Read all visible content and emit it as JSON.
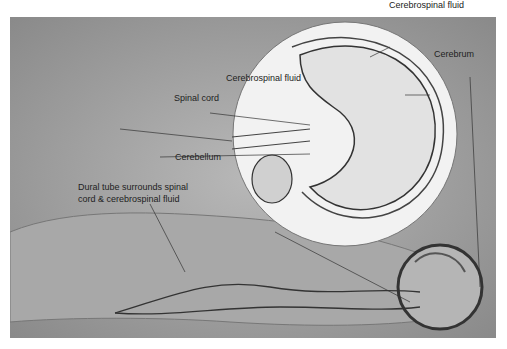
{
  "figure": {
    "labels": {
      "csf_top": "Cerebrospinal fluid",
      "csf_left": "Cerebrospinal fluid",
      "cerebrum": "Cerebrum",
      "spinal_cord": "Spinal cord",
      "cerebellum": "Cerebellum",
      "dural_tube_line1": "Dural tube surrounds spinal",
      "dural_tube_line2": "cord & cerebrospinal fluid"
    }
  }
}
